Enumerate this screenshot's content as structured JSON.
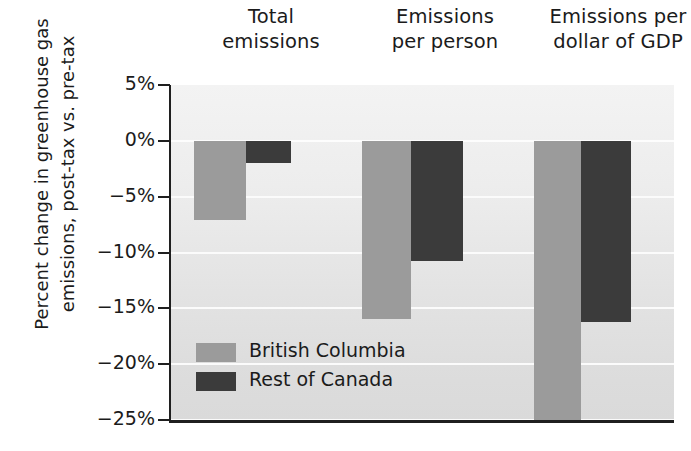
{
  "chart_data": {
    "type": "bar",
    "title": "",
    "subtitle": "",
    "xlabel": "",
    "ylabel_lines": [
      "Percent change in greenhouse gas",
      "emissions, post-tax vs. pre-tax"
    ],
    "ylabel": "Percent change in greenhouse gas emissions, post-tax vs. pre-tax",
    "categories": [
      "Total emissions",
      "Emissions per person",
      "Emissions per dollar of GDP"
    ],
    "category_lines": [
      [
        "Total",
        "emissions"
      ],
      [
        "Emissions",
        "per person"
      ],
      [
        "Emissions per",
        "dollar of GDP"
      ]
    ],
    "series": [
      {
        "name": "British Columbia",
        "color": "#9b9b9b",
        "values": [
          -7.1,
          -16.0,
          -25.3
        ]
      },
      {
        "name": "Rest of Canada",
        "color": "#3b3b3b",
        "values": [
          -2.0,
          -10.8,
          -16.2
        ]
      }
    ],
    "ylim": [
      -25,
      5
    ],
    "yticks": [
      5,
      0,
      -5,
      -10,
      -15,
      -20,
      -25
    ],
    "ytick_labels": [
      "5%",
      "0%",
      "−5%",
      "−10%",
      "−15%",
      "−20%",
      "−25%"
    ],
    "grid": true,
    "grid_axis": "y",
    "legend_position": "inside-lower-left",
    "plot_background": "#e8e8e8",
    "axis_color": "#1f1f1f",
    "value_unit": "percent"
  },
  "legend": {
    "items": [
      {
        "label": "British Columbia",
        "color": "#9b9b9b"
      },
      {
        "label": "Rest of Canada",
        "color": "#3b3b3b"
      }
    ]
  }
}
